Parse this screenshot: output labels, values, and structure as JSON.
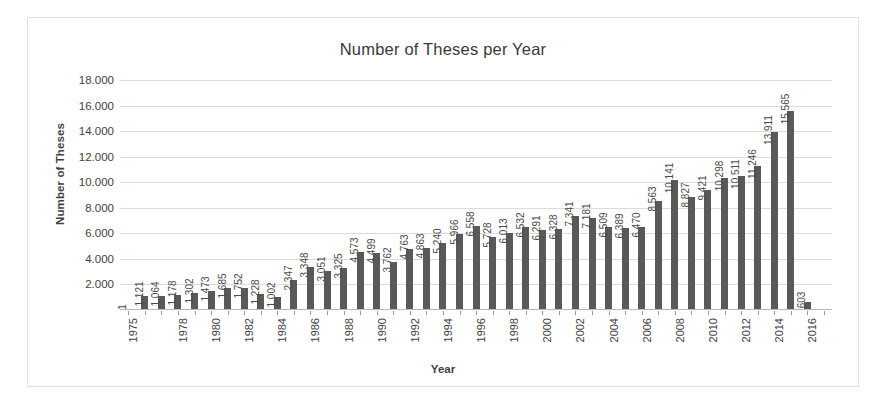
{
  "chart_data": {
    "type": "bar",
    "title": "Number of Theses per Year",
    "xlabel": "Year",
    "ylabel": "Number of Theses",
    "ylim": [
      0,
      18000
    ],
    "ytick_labels": [
      "18.000",
      "16.000",
      "14.000",
      "12.000",
      "10.000",
      "8.000",
      "6.000",
      "4.000",
      "2.000"
    ],
    "ytick_values": [
      18000,
      16000,
      14000,
      12000,
      10000,
      8000,
      6000,
      4000,
      2000
    ],
    "grid": true,
    "legend": null,
    "bar_color": "#595959",
    "grid_color": "#dcdcdc",
    "categories": [
      "1975",
      "1976",
      "1977",
      "1978",
      "1979",
      "1980",
      "1981",
      "1982",
      "1983",
      "1984",
      "1985",
      "1986",
      "1987",
      "1988",
      "1989",
      "1990",
      "1991",
      "1992",
      "1993",
      "1994",
      "1995",
      "1996",
      "1997",
      "1998",
      "1999",
      "2000",
      "2001",
      "2002",
      "2003",
      "2004",
      "2005",
      "2006",
      "2007",
      "2008",
      "2009",
      "2010",
      "2011",
      "2012",
      "2013",
      "2014",
      "2015",
      "2016",
      "2017"
    ],
    "xtick_labels": [
      "1975",
      "",
      "",
      "1978",
      "",
      "1980",
      "",
      "1982",
      "",
      "1984",
      "",
      "1986",
      "",
      "1988",
      "",
      "1990",
      "",
      "1992",
      "",
      "1994",
      "",
      "1996",
      "",
      "1998",
      "",
      "2000",
      "",
      "2002",
      "",
      "2004",
      "",
      "2006",
      "",
      "2008",
      "",
      "2010",
      "",
      "2012",
      "",
      "2014",
      "",
      "2016",
      ""
    ],
    "values": [
      1,
      1121,
      1064,
      1178,
      1302,
      1473,
      1685,
      1752,
      1228,
      1002,
      2347,
      3348,
      3051,
      3325,
      4573,
      4499,
      3762,
      4763,
      4863,
      5240,
      5966,
      6558,
      5728,
      6013,
      6532,
      6291,
      6328,
      7341,
      7181,
      6509,
      6389,
      6470,
      8563,
      10141,
      8827,
      9421,
      10298,
      10511,
      11246,
      13911,
      15565,
      603,
      0
    ],
    "value_labels": [
      "1",
      "1.121",
      "1.064",
      "1.178",
      "1.302",
      "1.473",
      "1.685",
      "1.752",
      "1.228",
      "1.002",
      "2.347",
      "3.348",
      "3.051",
      "3.325",
      "4.573",
      "4.499",
      "3.762",
      "4.763",
      "4.863",
      "5.240",
      "5.966",
      "6.558",
      "5.728",
      "6.013",
      "6.532",
      "6.291",
      "6.328",
      "7.341",
      "7.181",
      "6.509",
      "6.389",
      "6.470",
      "8.563",
      "10.141",
      "8.827",
      "9.421",
      "10.298",
      "10.511",
      "11.246",
      "13.911",
      "15.565",
      "603",
      ""
    ]
  }
}
